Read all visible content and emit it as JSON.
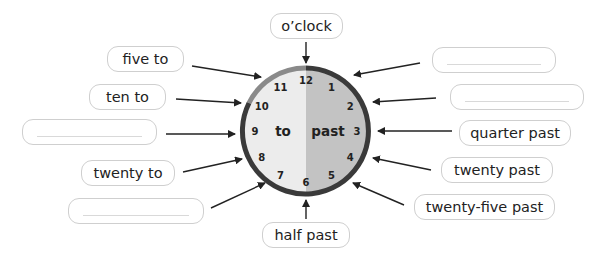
{
  "clock": {
    "left_half_label": "to",
    "right_half_label": "past",
    "numbers": [
      "12",
      "1",
      "2",
      "3",
      "4",
      "5",
      "6",
      "7",
      "8",
      "9",
      "10",
      "11"
    ],
    "colors": {
      "left_half": "#ececec",
      "right_half": "#c3c3c3",
      "rim": "#3a3a3a"
    }
  },
  "labels": {
    "oclock": "o’clock",
    "five_past": "",
    "ten_past": "",
    "quarter_past": "quarter past",
    "twenty_past": "twenty past",
    "twenty_five_past": "twenty-five past",
    "half_past": "half past",
    "twenty_five_to": "",
    "twenty_to": "twenty to",
    "quarter_to": "",
    "ten_to": "ten to",
    "five_to": "five to"
  }
}
